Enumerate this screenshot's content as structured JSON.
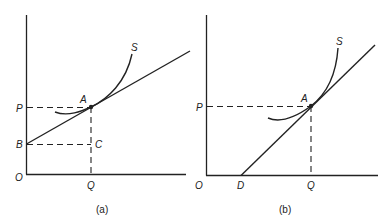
{
  "panels": [
    {
      "id": "a",
      "caption": "(a)",
      "labels": {
        "origin": "O",
        "price": "P",
        "intercept": "B",
        "quantity": "Q",
        "point": "A",
        "corner": "C",
        "curve": "S"
      }
    },
    {
      "id": "b",
      "caption": "(b)",
      "labels": {
        "origin": "O",
        "price": "P",
        "intercept": "D",
        "quantity": "Q",
        "point": "A",
        "curve": "S"
      }
    }
  ],
  "colors": {
    "ink": "#222222",
    "background": "#ffffff"
  }
}
